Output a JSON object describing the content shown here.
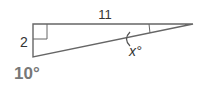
{
  "diagram": {
    "type": "right-triangle",
    "problem_number": "10°",
    "side_labels": {
      "top": "11",
      "left": "2"
    },
    "angle_label": "x°",
    "right_angle_at": "top-left",
    "colors": {
      "stroke": "#666666",
      "text": "#333333",
      "problem_number": "#777777"
    }
  }
}
